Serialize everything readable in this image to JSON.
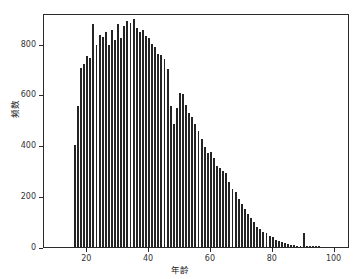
{
  "chart_data": {
    "type": "bar",
    "title": "",
    "xlabel": "年龄",
    "ylabel": "频数",
    "xlim": [
      6,
      105
    ],
    "ylim": [
      0,
      920
    ],
    "grid": false,
    "legend": "none",
    "bar_color": "#242424",
    "xticks": [
      20,
      40,
      60,
      80,
      100
    ],
    "yticks": [
      0,
      200,
      400,
      600,
      800
    ],
    "categories": [
      16,
      17,
      18,
      19,
      20,
      21,
      22,
      23,
      24,
      25,
      26,
      27,
      28,
      29,
      30,
      31,
      32,
      33,
      34,
      35,
      36,
      37,
      38,
      39,
      40,
      41,
      42,
      43,
      44,
      45,
      46,
      47,
      48,
      49,
      50,
      51,
      52,
      53,
      54,
      55,
      56,
      57,
      58,
      59,
      60,
      61,
      62,
      63,
      64,
      65,
      66,
      67,
      68,
      69,
      70,
      71,
      72,
      73,
      74,
      75,
      76,
      77,
      78,
      79,
      80,
      81,
      82,
      83,
      84,
      85,
      86,
      87,
      88,
      89,
      90,
      91,
      92,
      93,
      94,
      95
    ],
    "values": [
      400,
      555,
      705,
      720,
      750,
      745,
      875,
      795,
      835,
      825,
      845,
      795,
      855,
      815,
      875,
      820,
      870,
      890,
      880,
      895,
      860,
      845,
      855,
      830,
      820,
      800,
      785,
      760,
      755,
      740,
      700,
      555,
      485,
      545,
      605,
      600,
      560,
      525,
      510,
      485,
      455,
      425,
      395,
      370,
      375,
      350,
      320,
      310,
      300,
      290,
      255,
      230,
      215,
      190,
      170,
      150,
      130,
      115,
      100,
      80,
      70,
      60,
      55,
      45,
      40,
      28,
      22,
      18,
      14,
      10,
      8,
      6,
      5,
      4,
      55,
      3,
      2,
      2,
      1,
      1
    ],
    "annotations": [
      {
        "text": "isolated spike at age 90",
        "x": 90,
        "y": 55
      }
    ]
  }
}
